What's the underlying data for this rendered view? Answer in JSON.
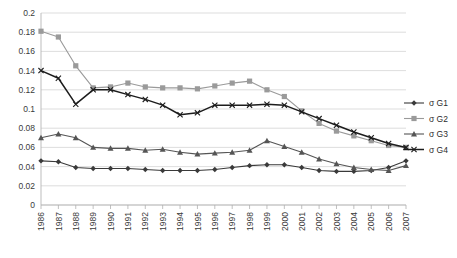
{
  "chart_data": {
    "type": "line",
    "title": "",
    "subtitle": "",
    "xlabel": "",
    "ylabel": "",
    "xlim": [
      1986,
      2007
    ],
    "ylim": [
      0,
      0.2
    ],
    "grid": true,
    "legend_position": "right",
    "ytick_labels": [
      "0.2",
      "0.18",
      "0.16",
      "0.14",
      "0.12",
      "0.1",
      "0.08",
      "0.06",
      "0.04",
      "0.02",
      "0"
    ],
    "ytick_values": [
      0.2,
      0.18,
      0.16,
      0.14,
      0.12,
      0.1,
      0.08,
      0.06,
      0.04,
      0.02,
      0
    ],
    "categories": [
      "1986",
      "1987",
      "1988",
      "1989",
      "1990",
      "1991",
      "1992",
      "1993",
      "1994",
      "1995",
      "1996",
      "1997",
      "1998",
      "1999",
      "2000",
      "2001",
      "2002",
      "2003",
      "2004",
      "2005",
      "2006",
      "2007"
    ],
    "series": [
      {
        "name": "σ G1",
        "marker": "diamond",
        "color": "#3a3a3a",
        "values": [
          0.046,
          0.045,
          0.039,
          0.038,
          0.038,
          0.038,
          0.037,
          0.036,
          0.036,
          0.036,
          0.037,
          0.039,
          0.041,
          0.042,
          0.042,
          0.039,
          0.036,
          0.035,
          0.035,
          0.036,
          0.039,
          0.046
        ]
      },
      {
        "name": "σ G2",
        "marker": "square",
        "color": "#9a9a9a",
        "values": [
          0.181,
          0.175,
          0.145,
          0.122,
          0.123,
          0.127,
          0.123,
          0.122,
          0.122,
          0.121,
          0.124,
          0.127,
          0.129,
          0.12,
          0.113,
          0.098,
          0.085,
          0.077,
          0.072,
          0.067,
          0.062,
          0.06
        ]
      },
      {
        "name": "σ G3",
        "marker": "triangle",
        "color": "#555555",
        "values": [
          0.07,
          0.074,
          0.07,
          0.06,
          0.059,
          0.059,
          0.057,
          0.058,
          0.055,
          0.053,
          0.054,
          0.055,
          0.057,
          0.067,
          0.061,
          0.055,
          0.048,
          0.043,
          0.039,
          0.037,
          0.036,
          0.041
        ]
      },
      {
        "name": "σ G4",
        "marker": "cross",
        "color": "#1c1c1c",
        "values": [
          0.14,
          0.132,
          0.105,
          0.12,
          0.12,
          0.115,
          0.11,
          0.104,
          0.094,
          0.096,
          0.104,
          0.104,
          0.104,
          0.105,
          0.104,
          0.097,
          0.09,
          0.083,
          0.076,
          0.07,
          0.064,
          0.06
        ]
      }
    ]
  }
}
